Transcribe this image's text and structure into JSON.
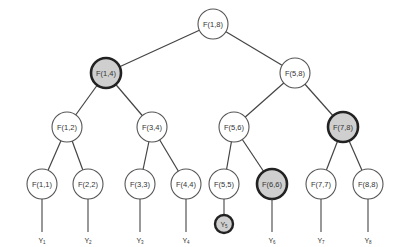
{
  "diagram": {
    "type": "binary-tree",
    "colors": {
      "edge": "#444444",
      "node_fill": "#ffffff",
      "node_stroke": "#555555",
      "highlight_fill": "#cfcfcf",
      "highlight_stroke": "#222222"
    },
    "nodes": [
      {
        "id": "n18",
        "label": "F(1,8)",
        "x": 213,
        "y": 24,
        "r": 15,
        "highlight": false
      },
      {
        "id": "n14",
        "label": "F(1,4)",
        "x": 106,
        "y": 73,
        "r": 15,
        "highlight": true
      },
      {
        "id": "n58",
        "label": "F(5,8)",
        "x": 295,
        "y": 73,
        "r": 15,
        "highlight": false
      },
      {
        "id": "n12",
        "label": "F(1,2)",
        "x": 67,
        "y": 127,
        "r": 15,
        "highlight": false
      },
      {
        "id": "n34",
        "label": "F(3,4)",
        "x": 152,
        "y": 127,
        "r": 15,
        "highlight": false
      },
      {
        "id": "n56",
        "label": "F(5,6)",
        "x": 234,
        "y": 127,
        "r": 15,
        "highlight": false
      },
      {
        "id": "n78",
        "label": "F(7,8)",
        "x": 343,
        "y": 127,
        "r": 15,
        "highlight": true
      },
      {
        "id": "n11",
        "label": "F(1,1)",
        "x": 42,
        "y": 184,
        "r": 15,
        "highlight": false
      },
      {
        "id": "n22",
        "label": "F(2,2)",
        "x": 88,
        "y": 184,
        "r": 15,
        "highlight": false
      },
      {
        "id": "n33",
        "label": "F(3,3)",
        "x": 140,
        "y": 184,
        "r": 15,
        "highlight": false
      },
      {
        "id": "n44",
        "label": "F(4,4)",
        "x": 186,
        "y": 184,
        "r": 15,
        "highlight": false
      },
      {
        "id": "n55",
        "label": "F(5,5)",
        "x": 224,
        "y": 184,
        "r": 15,
        "highlight": false
      },
      {
        "id": "n66",
        "label": "F(6,6)",
        "x": 272,
        "y": 184,
        "r": 15,
        "highlight": true
      },
      {
        "id": "n77",
        "label": "F(7,7)",
        "x": 321,
        "y": 184,
        "r": 15,
        "highlight": false
      },
      {
        "id": "n88",
        "label": "F(8,8)",
        "x": 368,
        "y": 184,
        "r": 15,
        "highlight": false
      }
    ],
    "edges": [
      [
        "n18",
        "n14"
      ],
      [
        "n18",
        "n58"
      ],
      [
        "n14",
        "n12"
      ],
      [
        "n14",
        "n34"
      ],
      [
        "n58",
        "n56"
      ],
      [
        "n58",
        "n78"
      ],
      [
        "n12",
        "n11"
      ],
      [
        "n12",
        "n22"
      ],
      [
        "n34",
        "n33"
      ],
      [
        "n34",
        "n44"
      ],
      [
        "n56",
        "n55"
      ],
      [
        "n56",
        "n66"
      ],
      [
        "n78",
        "n77"
      ],
      [
        "n78",
        "n88"
      ]
    ],
    "outputs": [
      {
        "label": "Y",
        "sub": "1",
        "x": 42,
        "y": 240,
        "parent": "n11",
        "circled": false
      },
      {
        "label": "Y",
        "sub": "2",
        "x": 88,
        "y": 240,
        "parent": "n22",
        "circled": false
      },
      {
        "label": "Y",
        "sub": "3",
        "x": 140,
        "y": 240,
        "parent": "n33",
        "circled": false
      },
      {
        "label": "Y",
        "sub": "4",
        "x": 186,
        "y": 240,
        "parent": "n44",
        "circled": false
      },
      {
        "label": "Y",
        "sub": "5",
        "x": 224,
        "y": 224,
        "parent": "n55",
        "circled": true
      },
      {
        "label": "Y",
        "sub": "6",
        "x": 272,
        "y": 240,
        "parent": "n66",
        "circled": false
      },
      {
        "label": "Y",
        "sub": "7",
        "x": 321,
        "y": 240,
        "parent": "n77",
        "circled": false
      },
      {
        "label": "Y",
        "sub": "8",
        "x": 368,
        "y": 240,
        "parent": "n88",
        "circled": false
      }
    ]
  }
}
